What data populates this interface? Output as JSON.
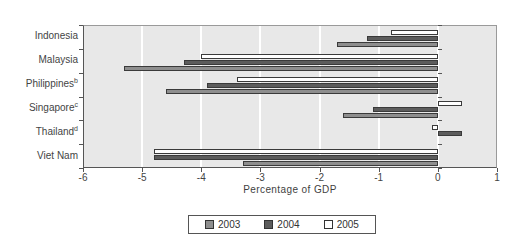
{
  "chart_data": {
    "type": "bar",
    "orientation": "horizontal",
    "title": "",
    "xlabel": "Percentage of GDP",
    "xlim": [
      -6,
      1
    ],
    "xtick_values": [
      -6,
      -5,
      -4,
      -3,
      -2,
      -1,
      0,
      1
    ],
    "xticks": [
      "-6",
      "-5",
      "-4",
      "-3",
      "-2",
      "-1",
      "0",
      "1"
    ],
    "categories": [
      "Indonesia",
      "Malaysia",
      "Philippines",
      "Singapore",
      "Thailand",
      "Viet Nam"
    ],
    "category_superscripts": [
      "",
      "",
      "b",
      "c",
      "d",
      ""
    ],
    "series": [
      {
        "name": "2003",
        "color": "#8e8e8e",
        "values": [
          -1.7,
          -5.3,
          -4.6,
          -1.6,
          0.0,
          -3.3
        ]
      },
      {
        "name": "2004",
        "color": "#5c5c5c",
        "values": [
          -1.2,
          -4.3,
          -3.9,
          -1.1,
          0.4,
          -4.8
        ]
      },
      {
        "name": "2005",
        "color": "#ffffff",
        "values": [
          -0.8,
          -4.0,
          -3.4,
          0.4,
          -0.1,
          -4.8
        ]
      }
    ],
    "legend_position": "bottom",
    "grid": true,
    "colors": {
      "plot_bg": "#e8e8e8",
      "gridline": "#ffffff",
      "bar_border": "#3a3a3a",
      "axis": "#555555",
      "frame": "#9a9a9a",
      "text": "#444444",
      "background": "#ffffff"
    }
  }
}
